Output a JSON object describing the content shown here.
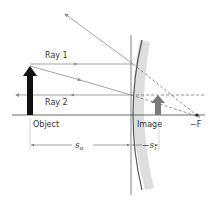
{
  "diagram": {
    "labels": {
      "ray1": "Ray 1",
      "ray2": "Ray 2",
      "object": "Object",
      "image": "Image",
      "focal_point": "−F",
      "object_distance": "s",
      "object_distance_sub": "o",
      "image_distance": "−s",
      "image_distance_sub": "i"
    },
    "colors": {
      "ray": "#8a8a8a",
      "object_arrow": "#111111",
      "image_arrow": "#7a7a7a",
      "mirror_band": "#d9d9d9",
      "mirror_line": "#555555",
      "axis": "#444444"
    }
  }
}
